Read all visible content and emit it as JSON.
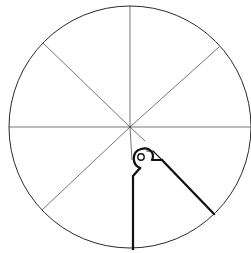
{
  "diagram": {
    "type": "divided-circle",
    "divisions": 8,
    "circle": {
      "cx": 130,
      "cy": 127,
      "r": 121
    },
    "radial_lines": [
      {
        "x1": 130,
        "y1": 6,
        "x2": 130,
        "y2": 127
      },
      {
        "x1": 219,
        "y1": 47,
        "x2": 130,
        "y2": 127
      },
      {
        "x1": 251,
        "y1": 127,
        "x2": 130,
        "y2": 127
      },
      {
        "x1": 43,
        "y1": 43,
        "x2": 130,
        "y2": 127
      },
      {
        "x1": 9,
        "y1": 127,
        "x2": 130,
        "y2": 127
      },
      {
        "x1": 42,
        "y1": 210,
        "x2": 130,
        "y2": 127
      },
      {
        "x1": 130,
        "y1": 127,
        "x2": 145,
        "y2": 141
      }
    ],
    "highlighted_sector": {
      "description": "bold wedge between the downward radius and the lower-right diagonal, with a looped hinge near the center",
      "stroke_color": "#111111"
    }
  }
}
